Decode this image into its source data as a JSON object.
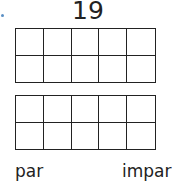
{
  "worksheet": {
    "number": "19",
    "ten_frames": [
      {
        "rows": 2,
        "cols": 5,
        "filled": 0
      },
      {
        "rows": 2,
        "cols": 5,
        "filled": 0
      }
    ],
    "options": [
      {
        "label": "par"
      },
      {
        "label": "impar"
      }
    ],
    "colors": {
      "ink": "#222222",
      "bullet": "#5a8fc4"
    }
  }
}
